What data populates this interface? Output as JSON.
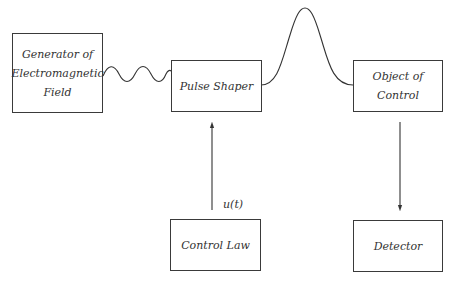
{
  "diagram": {
    "nodes": [
      {
        "id": "generator",
        "lines": [
          "Generator of",
          "Electromagnetic",
          "Field"
        ]
      },
      {
        "id": "pulse_shaper",
        "lines": [
          "Pulse Shaper"
        ]
      },
      {
        "id": "object",
        "lines": [
          "Object of",
          "Control"
        ]
      },
      {
        "id": "control_law",
        "lines": [
          "Control Law"
        ]
      },
      {
        "id": "detector",
        "lines": [
          "Detector"
        ]
      }
    ],
    "edges": [
      {
        "from": "generator",
        "to": "pulse_shaper",
        "style": "sine-wave"
      },
      {
        "from": "pulse_shaper",
        "to": "object",
        "style": "gaussian-pulse"
      },
      {
        "from": "control_law",
        "to": "pulse_shaper",
        "style": "arrow",
        "label": "u(t)"
      },
      {
        "from": "object",
        "to": "detector",
        "style": "arrow"
      }
    ],
    "signal_label": "u(t)"
  }
}
